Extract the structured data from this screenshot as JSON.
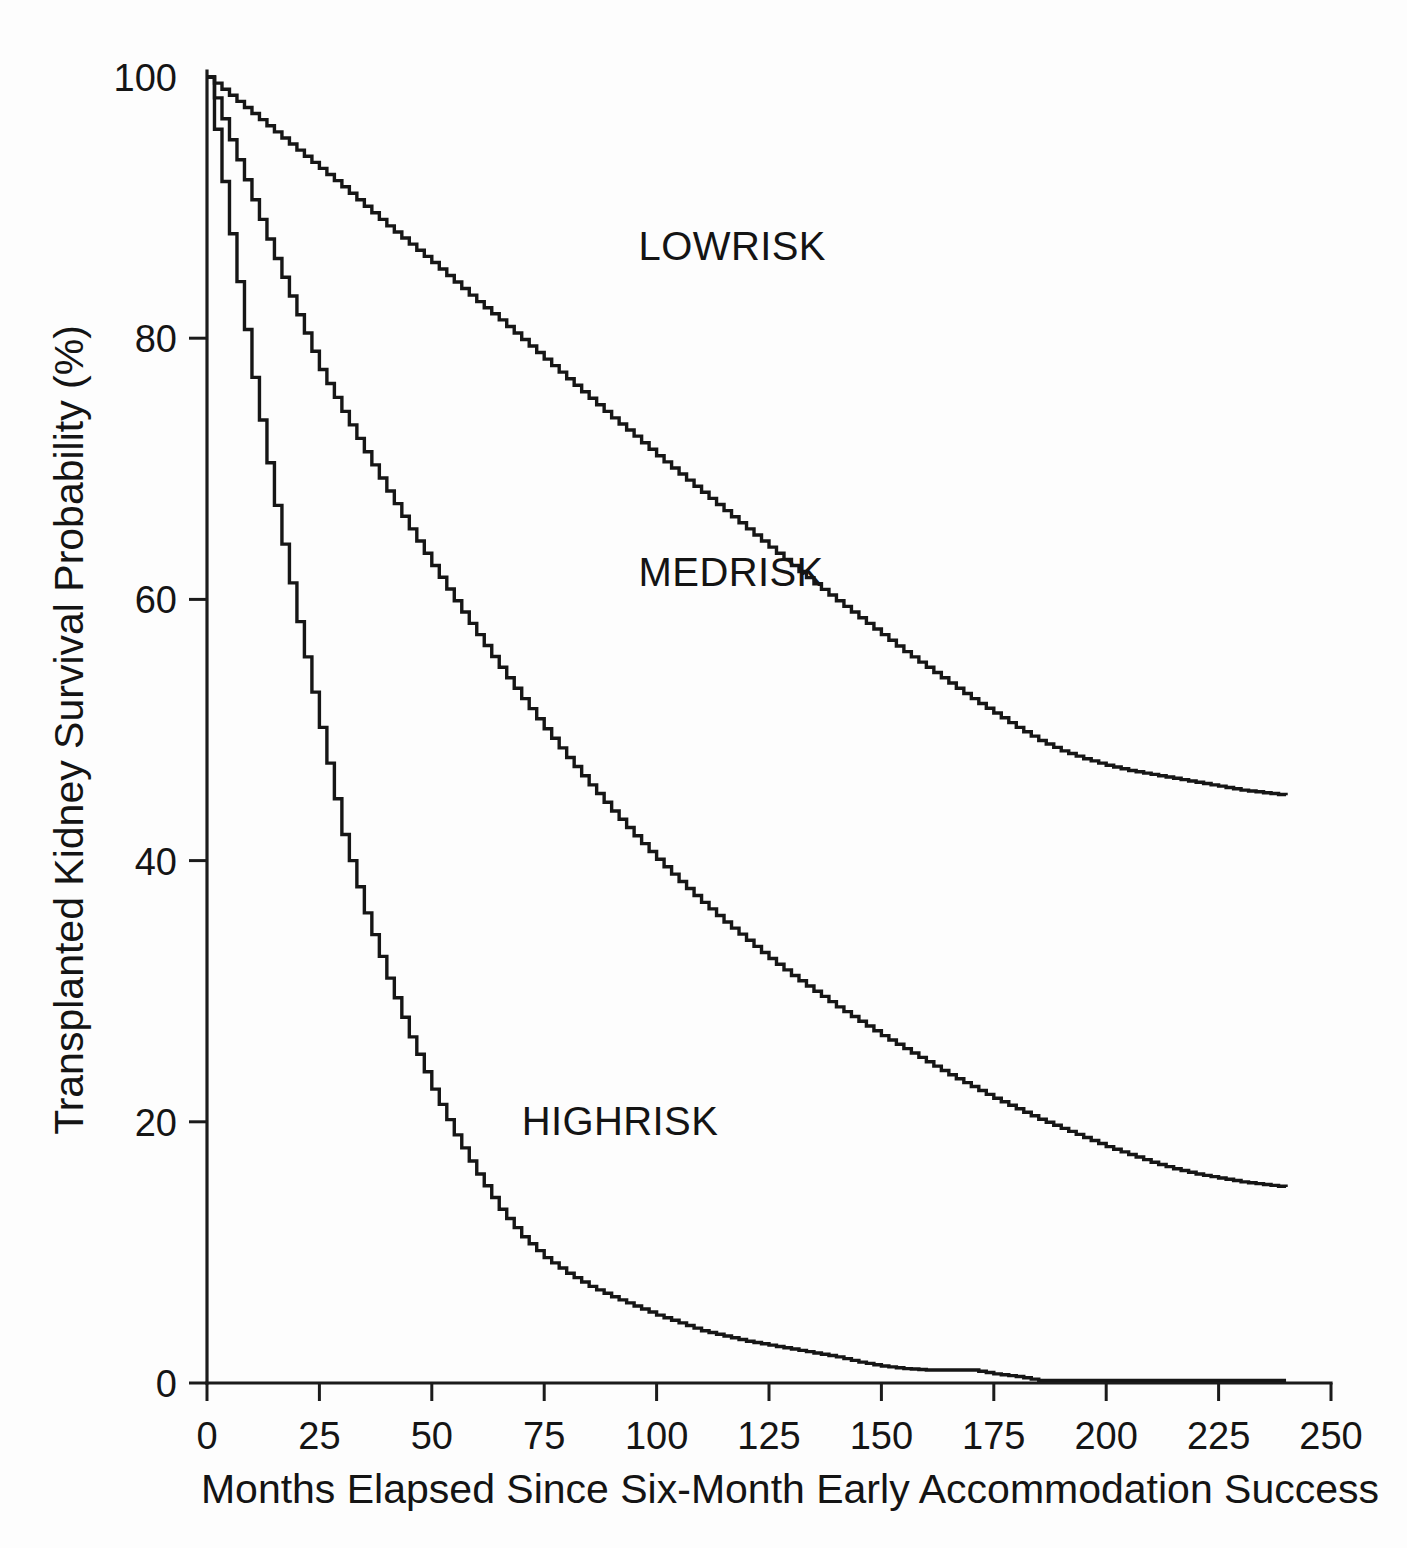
{
  "chart_data": {
    "type": "line",
    "title": "",
    "subtitle": "",
    "xlabel": "Months Elapsed Since Six-Month Early Accommodation Success",
    "ylabel": "Transplanted Kidney Survival Probability (%)",
    "xlim": [
      0,
      250
    ],
    "ylim": [
      0,
      100
    ],
    "xticks": [
      0,
      25,
      50,
      75,
      100,
      125,
      150,
      175,
      200,
      225,
      250
    ],
    "xtick_labels": [
      "0",
      "25",
      "50",
      "75",
      "100",
      "125",
      "150",
      "175",
      "200",
      "225",
      "250"
    ],
    "yticks": [
      0,
      20,
      40,
      60,
      80,
      100
    ],
    "ytick_labels": [
      "0",
      "20",
      "40",
      "60",
      "80",
      "100"
    ],
    "grid": false,
    "legend_position": "inline-annotations",
    "curve_style": "kaplan-meier step function",
    "line_color": "#161616",
    "series": [
      {
        "name": "LOWRISK",
        "label_x": 96,
        "label_y": 86,
        "x": [
          0,
          5,
          10,
          15,
          20,
          25,
          30,
          35,
          40,
          45,
          50,
          55,
          60,
          65,
          70,
          75,
          80,
          85,
          90,
          95,
          100,
          105,
          110,
          115,
          120,
          125,
          130,
          135,
          140,
          145,
          150,
          155,
          160,
          165,
          170,
          175,
          180,
          185,
          190,
          195,
          200,
          205,
          210,
          215,
          220,
          225,
          230,
          235,
          240
        ],
        "values": [
          100,
          98.6,
          97.2,
          95.8,
          94.4,
          93.0,
          91.6,
          90.1,
          88.6,
          87.2,
          85.8,
          84.3,
          82.8,
          81.4,
          79.9,
          78.4,
          76.9,
          75.4,
          73.9,
          72.5,
          71.0,
          69.6,
          68.2,
          66.8,
          65.4,
          64.0,
          62.6,
          61.2,
          59.9,
          58.6,
          57.3,
          56.0,
          54.8,
          53.6,
          52.4,
          51.3,
          50.2,
          49.2,
          48.4,
          47.8,
          47.3,
          46.9,
          46.6,
          46.3,
          46.0,
          45.7,
          45.4,
          45.2,
          45.0
        ]
      },
      {
        "name": "MEDRISK",
        "label_x": 96,
        "label_y": 61,
        "x": [
          0,
          5,
          10,
          15,
          20,
          25,
          30,
          35,
          40,
          45,
          50,
          55,
          60,
          65,
          70,
          75,
          80,
          85,
          90,
          95,
          100,
          105,
          110,
          115,
          120,
          125,
          130,
          135,
          140,
          145,
          150,
          155,
          160,
          165,
          170,
          175,
          180,
          185,
          190,
          195,
          200,
          205,
          210,
          215,
          220,
          225,
          230,
          235,
          240
        ],
        "values": [
          100,
          95.2,
          90.6,
          86.1,
          81.8,
          77.6,
          74.4,
          71.3,
          68.3,
          65.4,
          62.6,
          59.9,
          57.3,
          54.8,
          52.4,
          50.1,
          47.9,
          45.8,
          43.8,
          41.9,
          40.1,
          38.4,
          36.8,
          35.3,
          33.9,
          32.5,
          31.2,
          30.0,
          28.8,
          27.7,
          26.6,
          25.6,
          24.6,
          23.6,
          22.7,
          21.8,
          21.0,
          20.2,
          19.5,
          18.8,
          18.1,
          17.5,
          16.9,
          16.4,
          16.0,
          15.7,
          15.4,
          15.2,
          15.0
        ]
      },
      {
        "name": "HIGHRISK",
        "label_x": 70,
        "label_y": 19,
        "x": [
          0,
          5,
          10,
          15,
          20,
          25,
          30,
          35,
          40,
          45,
          50,
          55,
          60,
          65,
          70,
          75,
          80,
          85,
          90,
          95,
          100,
          105,
          110,
          115,
          120,
          125,
          130,
          135,
          140,
          145,
          150,
          155,
          160,
          165,
          170,
          175,
          180,
          185,
          190,
          200,
          210,
          220,
          230,
          240
        ],
        "values": [
          100,
          88.0,
          77.0,
          67.2,
          58.3,
          50.2,
          42.0,
          36.0,
          31.0,
          26.5,
          22.5,
          19.0,
          16.0,
          13.3,
          11.2,
          9.6,
          8.4,
          7.4,
          6.6,
          5.9,
          5.2,
          4.6,
          4.0,
          3.6,
          3.2,
          2.9,
          2.6,
          2.3,
          2.0,
          1.6,
          1.3,
          1.1,
          1.0,
          1.0,
          1.0,
          0.7,
          0.5,
          0.2,
          0.2,
          0.2,
          0.2,
          0.2,
          0.2,
          0.2
        ]
      }
    ]
  },
  "geometry": {
    "plot_left_px": 207,
    "plot_right_px": 1331,
    "plot_top_px": 77,
    "plot_bottom_px": 1383
  }
}
